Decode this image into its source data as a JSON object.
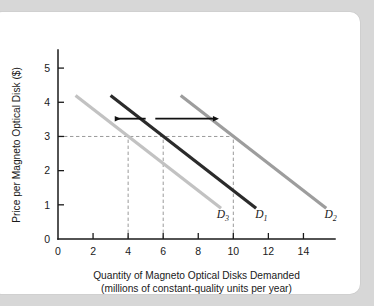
{
  "figure": {
    "background_color": "#d7d7d7",
    "card_color": "#ffffff"
  },
  "chart_data": {
    "type": "line",
    "title": "",
    "xlabel": "Quantity of Magneto Optical Disks Demanded",
    "xlabel_line2": "(millions of constant-quality units per year)",
    "ylabel": "Price per Magneto Optical Disk ($)",
    "xlim": [
      0,
      15.8
    ],
    "ylim": [
      0,
      5.5
    ],
    "xticks": [
      0,
      2,
      4,
      6,
      8,
      10,
      12,
      14
    ],
    "xticklabels": [
      "0",
      "2",
      "4",
      "6",
      "8",
      "10",
      "12",
      "14"
    ],
    "yticks": [
      0,
      1,
      2,
      3,
      4,
      5
    ],
    "yticklabels": [
      "0",
      "1",
      "2",
      "3",
      "4",
      "5"
    ],
    "grid": false,
    "legend": "none",
    "series": [
      {
        "name": "D3",
        "label": "D",
        "label_sub": "3",
        "color": "#c2c2c2",
        "linewidth": 3.2,
        "x": [
          1.0,
          9.3
        ],
        "y": [
          4.2,
          0.9
        ],
        "label_x": 9.05,
        "label_y": 0.62
      },
      {
        "name": "D1",
        "label": "D",
        "label_sub": "1",
        "color": "#2b2b2b",
        "linewidth": 3.2,
        "x": [
          3.0,
          11.3
        ],
        "y": [
          4.2,
          0.9
        ],
        "label_x": 11.25,
        "label_y": 0.62
      },
      {
        "name": "D2",
        "label": "D",
        "label_sub": "2",
        "color": "#9d9d9d",
        "linewidth": 3.2,
        "x": [
          7.0,
          15.3
        ],
        "y": [
          4.2,
          0.9
        ],
        "label_x": 15.2,
        "label_y": 0.62
      }
    ],
    "guides": {
      "price_level": 3,
      "horizontal_line": {
        "y": 3,
        "x_from": 0,
        "x_to": 10
      },
      "vertical_lines": [
        {
          "x": 4,
          "y_from": 0,
          "y_to": 3
        },
        {
          "x": 6,
          "y_from": 0,
          "y_to": 3
        },
        {
          "x": 10,
          "y_from": 0,
          "y_to": 3
        }
      ]
    },
    "annotations": [
      {
        "name": "leftward-shift-arrow",
        "direction": "left",
        "y": 3.52,
        "x_tail": 5.0,
        "x_head": 3.25
      },
      {
        "name": "rightward-shift-arrow",
        "direction": "right",
        "y": 3.52,
        "x_tail": 5.55,
        "x_head": 8.85
      }
    ]
  }
}
